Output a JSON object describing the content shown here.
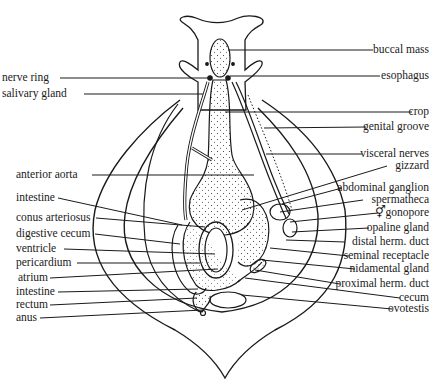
{
  "figure": {
    "left_labels": [
      {
        "text": "nerve ring",
        "y": 78
      },
      {
        "text": "salivary gland",
        "y": 94
      },
      {
        "text": "anterior aorta",
        "y": 175
      },
      {
        "text": "intestine",
        "y": 198
      },
      {
        "text": "conus arteriosus",
        "y": 218
      },
      {
        "text": "digestive cecum",
        "y": 234
      },
      {
        "text": "ventricle",
        "y": 249
      },
      {
        "text": "pericardium",
        "y": 263
      },
      {
        "text": "atrium",
        "y": 278
      },
      {
        "text": "intestine",
        "y": 292
      },
      {
        "text": "rectum",
        "y": 305
      },
      {
        "text": "anus",
        "y": 318
      }
    ],
    "right_labels": [
      {
        "text": "buccal mass",
        "y": 50
      },
      {
        "text": "esophagus",
        "y": 76
      },
      {
        "text": "crop",
        "y": 112
      },
      {
        "text": "genital groove",
        "y": 127
      },
      {
        "text": "visceral nerves",
        "y": 154
      },
      {
        "text": "gizzard",
        "y": 166
      },
      {
        "text": "abdominal ganglion",
        "y": 188
      },
      {
        "text": "spermatheca",
        "y": 200
      },
      {
        "text": "gonopore",
        "y": 213,
        "symbol": "⚥"
      },
      {
        "text": "opaline gland",
        "y": 228
      },
      {
        "text": "distal herm. duct",
        "y": 242
      },
      {
        "text": "seminal receptacle",
        "y": 256
      },
      {
        "text": "nidamental gland",
        "y": 269
      },
      {
        "text": "proximal herm. duct",
        "y": 284
      },
      {
        "text": "cecum",
        "y": 298
      },
      {
        "text": "ovotestis",
        "y": 309
      }
    ]
  }
}
